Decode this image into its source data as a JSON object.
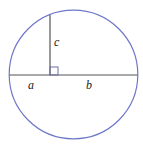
{
  "diagram": {
    "type": "geometry",
    "labels": {
      "a": "a",
      "b": "b",
      "c": "c"
    },
    "colors": {
      "circle": "#6e78c8",
      "lines": "#555555",
      "text": "#222222"
    }
  }
}
